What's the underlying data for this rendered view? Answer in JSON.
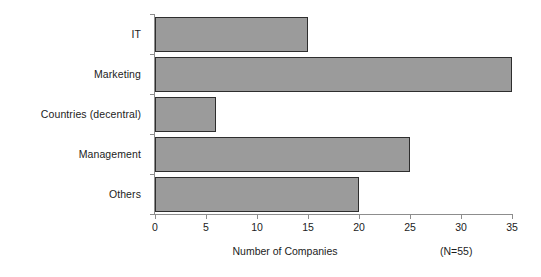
{
  "chart_data": {
    "type": "bar",
    "orientation": "horizontal",
    "title": "",
    "xlabel": "Number of Companies",
    "ylabel": "",
    "categories": [
      "IT",
      "Marketing",
      "Countries (decentral)",
      "Management",
      "Others"
    ],
    "values": [
      15,
      35,
      6,
      25,
      20
    ],
    "series": [
      {
        "name": "Number of Companies",
        "values": [
          15,
          35,
          6,
          25,
          20
        ]
      }
    ],
    "xlim": [
      0,
      35
    ],
    "xticks": [
      0,
      5,
      10,
      15,
      20,
      25,
      30,
      35
    ],
    "xtick_labels": [
      "0",
      "5",
      "10",
      "15",
      "20",
      "25",
      "30",
      "35"
    ],
    "grid": false,
    "legend": false,
    "legend_position": "none",
    "annotations": [
      "(N=55)"
    ],
    "sample_size_note": "(N=55)",
    "colors": {
      "bar_fill": "#9b9b9b",
      "bar_border": "#2e2e2e",
      "axis": "#8d8d8d",
      "text": "#1c1c1c",
      "background": "#ffffff"
    }
  },
  "footer": {
    "axis_title": "Number of Companies",
    "sample_note": "(N=55)"
  }
}
